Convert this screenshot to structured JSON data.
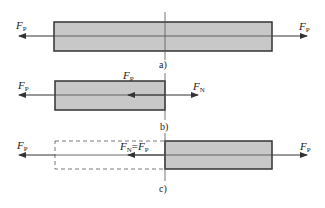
{
  "colors": {
    "bar_fill": "#c8c8c8",
    "bar_stroke": "#333333",
    "line": "#333333",
    "dashed": "#555555",
    "background": "#ffffff"
  },
  "figure_a": {
    "caption": "a)",
    "left_force": {
      "symbol": "F",
      "sub": "P"
    },
    "right_force": {
      "symbol": "F",
      "sub": "P"
    }
  },
  "figure_b": {
    "caption": "b)",
    "left_force": {
      "symbol": "F",
      "sub": "P"
    },
    "top_force": {
      "symbol": "F",
      "sub": "P"
    },
    "right_force": {
      "symbol": "F",
      "sub": "N"
    }
  },
  "figure_c": {
    "caption": "c)",
    "left_force": {
      "symbol": "F",
      "sub": "P"
    },
    "internal_force": {
      "symbol1": "F",
      "sub1": "N",
      "eq": "=",
      "symbol2": "F",
      "sub2": "P"
    },
    "right_force": {
      "symbol": "F",
      "sub": "P"
    }
  }
}
